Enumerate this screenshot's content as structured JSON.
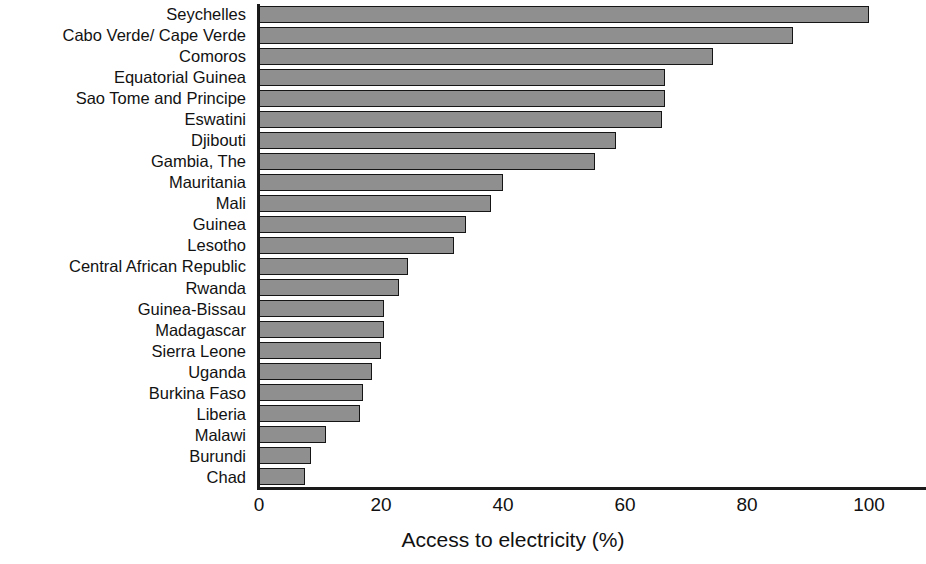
{
  "chart_data": {
    "type": "bar",
    "orientation": "horizontal",
    "title": "",
    "subtitle": "",
    "xlabel": "Access to electricity (%)",
    "ylabel": "",
    "xlim": [
      0,
      100
    ],
    "xticks": [
      0,
      20,
      40,
      60,
      80,
      100
    ],
    "xtick_labels": [
      "0",
      "20",
      "40",
      "60",
      "80",
      "100"
    ],
    "grid": false,
    "legend": null,
    "bar_color": "#8f8f8f",
    "bar_edge_color": "#151515",
    "axis_color": "#1a1a1a",
    "categories": [
      "Seychelles",
      "Cabo Verde/ Cape Verde",
      "Comoros",
      "Equatorial Guinea",
      "Sao Tome and Principe",
      "Eswatini",
      "Djibouti",
      "Gambia, The",
      "Mauritania",
      "Mali",
      "Guinea",
      "Lesotho",
      "Central African Republic",
      "Rwanda",
      "Guinea-Bissau",
      "Madagascar",
      "Sierra Leone",
      "Uganda",
      "Burkina Faso",
      "Liberia",
      "Malawi",
      "Burundi",
      "Chad"
    ],
    "values": [
      100.0,
      87.5,
      74.5,
      66.5,
      66.5,
      66.0,
      58.5,
      55.0,
      40.0,
      38.0,
      34.0,
      32.0,
      24.5,
      23.0,
      20.5,
      20.5,
      20.0,
      18.5,
      17.0,
      16.5,
      11.0,
      8.5,
      7.5
    ]
  }
}
